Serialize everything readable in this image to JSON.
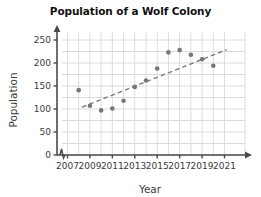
{
  "chart_data": {
    "type": "scatter",
    "title": "Population of a Wolf Colony",
    "xlabel": "Year",
    "ylabel": "Population",
    "xlim": [
      2006.4,
      2021.6
    ],
    "ylim": [
      0,
      265
    ],
    "xticks": [
      2007,
      2009,
      2011,
      2013,
      2015,
      2017,
      2019,
      2021
    ],
    "yticks": [
      0,
      50,
      100,
      150,
      200,
      250
    ],
    "grid": true,
    "grid_x_step": 1,
    "grid_y_step": 25,
    "legend": "none",
    "axis_break_x": true,
    "point_color": "#777777",
    "grid_color": "#dcdcdc",
    "axis_color": "#4a4a4a",
    "trendline_color": "#7a7a7a",
    "x": [
      2008,
      2009,
      2010,
      2011,
      2012,
      2013,
      2014,
      2015,
      2016,
      2017,
      2018,
      2019,
      2020
    ],
    "y": [
      141,
      107,
      97,
      101,
      118,
      148,
      162,
      188,
      223,
      228,
      218,
      208,
      194
    ],
    "points": [
      {
        "year": 2008,
        "population": 141
      },
      {
        "year": 2009,
        "population": 107
      },
      {
        "year": 2010,
        "population": 97
      },
      {
        "year": 2011,
        "population": 101
      },
      {
        "year": 2012,
        "population": 118
      },
      {
        "year": 2013,
        "population": 148
      },
      {
        "year": 2014,
        "population": 162
      },
      {
        "year": 2015,
        "population": 188
      },
      {
        "year": 2016,
        "population": 223
      },
      {
        "year": 2017,
        "population": 228
      },
      {
        "year": 2018,
        "population": 218
      },
      {
        "year": 2019,
        "population": 208
      },
      {
        "year": 2020,
        "population": 194
      }
    ],
    "trendline": {
      "style": "dashed",
      "x_start": 2008.3,
      "y_start": 104,
      "x_end": 2021.2,
      "y_end": 229
    }
  }
}
